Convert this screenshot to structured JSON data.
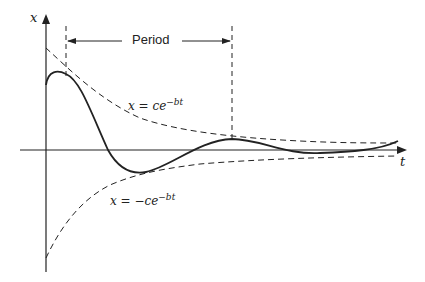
{
  "diagram": {
    "axes": {
      "y_label": "x",
      "x_label": "t"
    },
    "period_label": "Period",
    "upper_envelope_label": {
      "lhs": "x = ce",
      "exp": "−bt"
    },
    "lower_envelope_label": {
      "lhs": "x = −ce",
      "exp": "−bt"
    },
    "colors": {
      "ink": "#222222",
      "background": "#ffffff"
    }
  }
}
